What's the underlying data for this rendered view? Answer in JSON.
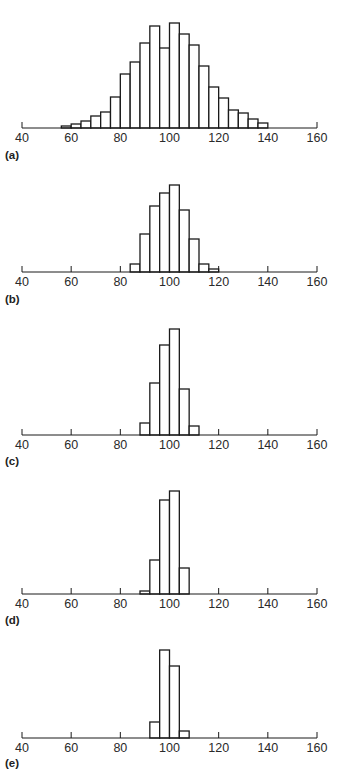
{
  "chart_data": [
    {
      "type": "bar",
      "panel_label": "(a)",
      "title": "",
      "xlabel": "",
      "ylabel": "",
      "xlim": [
        40,
        160
      ],
      "x_ticks": [
        "40",
        "60",
        "80",
        "100",
        "120",
        "140",
        "160"
      ],
      "axis_ticks_shown": "ends",
      "bin_width": 4,
      "bin_starts": [
        56,
        60,
        64,
        68,
        72,
        76,
        80,
        84,
        88,
        92,
        96,
        100,
        104,
        108,
        112,
        116,
        120,
        124,
        128,
        132,
        136
      ],
      "values": [
        2,
        4,
        7,
        12,
        16,
        31,
        54,
        66,
        85,
        102,
        80,
        105,
        94,
        83,
        62,
        41,
        30,
        18,
        15,
        9,
        5
      ],
      "grid": false
    },
    {
      "type": "bar",
      "panel_label": "(b)",
      "xlim": [
        40,
        160
      ],
      "x_ticks": [
        "40",
        "60",
        "80",
        "100",
        "120",
        "140",
        "160"
      ],
      "axis_ticks_shown": "all",
      "bin_width": 4,
      "bin_starts": [
        84,
        88,
        92,
        96,
        100,
        104,
        108,
        112,
        116
      ],
      "values": [
        8,
        38,
        66,
        79,
        87,
        62,
        33,
        8,
        3
      ],
      "grid": false
    },
    {
      "type": "bar",
      "panel_label": "(c)",
      "xlim": [
        40,
        160
      ],
      "x_ticks": [
        "40",
        "60",
        "80",
        "100",
        "120",
        "140",
        "160"
      ],
      "axis_ticks_shown": "all",
      "bin_width": 4,
      "bin_starts": [
        88,
        92,
        96,
        100,
        104,
        108
      ],
      "values": [
        12,
        52,
        90,
        106,
        46,
        9
      ],
      "grid": false
    },
    {
      "type": "bar",
      "panel_label": "(d)",
      "xlim": [
        40,
        160
      ],
      "x_ticks": [
        "40",
        "60",
        "80",
        "100",
        "120",
        "140",
        "160"
      ],
      "axis_ticks_shown": "all",
      "bin_width": 4,
      "bin_starts": [
        88,
        92,
        96,
        100,
        104
      ],
      "values": [
        3,
        34,
        94,
        103,
        26
      ],
      "grid": false
    },
    {
      "type": "bar",
      "panel_label": "(e)",
      "xlim": [
        40,
        160
      ],
      "x_ticks": [
        "40",
        "60",
        "80",
        "100",
        "120",
        "140",
        "160"
      ],
      "axis_ticks_shown": "all",
      "bin_width": 4,
      "bin_starts": [
        92,
        96,
        100,
        104
      ],
      "values": [
        16,
        88,
        72,
        7
      ],
      "grid": false
    }
  ],
  "colors": {
    "line": "#1a1a1a",
    "bar_fill": "#ffffff",
    "background": "#ffffff"
  },
  "layout": {
    "x0_px": 22,
    "x1_px": 317,
    "panels": [
      {
        "baseline": 128,
        "label_y": 149
      },
      {
        "baseline": 272,
        "label_y": 293
      },
      {
        "baseline": 435,
        "label_y": 455
      },
      {
        "baseline": 594,
        "label_y": 614
      },
      {
        "baseline": 738,
        "label_y": 757
      }
    ]
  }
}
